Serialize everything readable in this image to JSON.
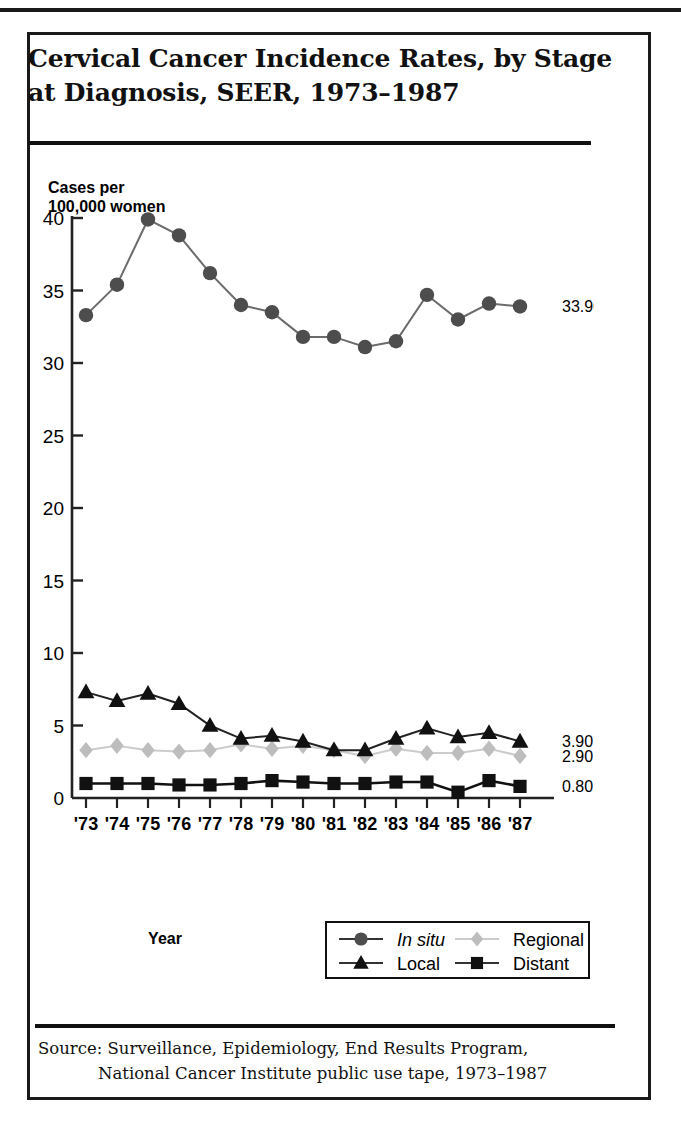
{
  "figure": {
    "title_line_1": "Cervical Cancer Incidence Rates, by Stage",
    "title_line_2": "at Diagnosis, SEER, 1973–1987",
    "source_line_1": "Source: Surveillance, Epidemiology, End Results Program,",
    "source_line_2": "National Cancer Institute public use tape, 1973–1987"
  },
  "chart_data": {
    "type": "line",
    "title": "Cervical Cancer Incidence Rates, by Stage at Diagnosis, SEER, 1973–1987",
    "xlabel": "Year",
    "ylabel": "Cases per 100,000 women",
    "ylabel_line_1": "Cases per",
    "ylabel_line_2": "100,000 women",
    "grid": false,
    "legend_position": "bottom-right",
    "ylim": [
      0,
      40
    ],
    "yticks": [
      0,
      5,
      10,
      15,
      20,
      25,
      30,
      35,
      40
    ],
    "ytick_labels": [
      "0",
      "5",
      "10",
      "15",
      "20",
      "25",
      "30",
      "35",
      "40"
    ],
    "categories": [
      "1973",
      "1974",
      "1975",
      "1976",
      "1977",
      "1978",
      "1979",
      "1980",
      "1981",
      "1982",
      "1983",
      "1984",
      "1985",
      "1986",
      "1987"
    ],
    "tick_labels": [
      "'73",
      "'74",
      "'75",
      "'76",
      "'77",
      "'78",
      "'79",
      "'80",
      "'81",
      "'82",
      "'83",
      "'84",
      "'85",
      "'86",
      "'87"
    ],
    "series": [
      {
        "name": "In situ",
        "italic": true,
        "marker": "circle",
        "color": "#4d4d4d",
        "line_color": "#6b6b6b",
        "end_label": "33.90",
        "values": [
          33.3,
          35.4,
          39.9,
          38.8,
          36.2,
          34.0,
          33.5,
          31.8,
          31.8,
          31.1,
          31.5,
          34.7,
          33.0,
          34.1,
          33.9
        ]
      },
      {
        "name": "Local",
        "italic": false,
        "marker": "triangle",
        "color": "#111111",
        "line_color": "#222222",
        "end_label": "3.90",
        "values": [
          7.3,
          6.7,
          7.2,
          6.5,
          5.0,
          4.1,
          4.3,
          3.9,
          3.3,
          3.3,
          4.1,
          4.8,
          4.2,
          4.5,
          3.9
        ]
      },
      {
        "name": "Regional",
        "italic": false,
        "marker": "diamond",
        "color": "#bdbdbd",
        "line_color": "#cccccc",
        "end_label": "2.90",
        "values": [
          3.3,
          3.6,
          3.3,
          3.2,
          3.3,
          3.7,
          3.4,
          3.6,
          3.3,
          2.9,
          3.4,
          3.1,
          3.1,
          3.4,
          2.9
        ]
      },
      {
        "name": "Distant",
        "italic": false,
        "marker": "square",
        "color": "#111111",
        "line_color": "#111111",
        "end_label": "0.80",
        "values": [
          1.0,
          1.0,
          1.0,
          0.9,
          0.9,
          1.0,
          1.2,
          1.1,
          1.0,
          1.0,
          1.1,
          1.1,
          0.4,
          1.2,
          0.8
        ]
      }
    ]
  },
  "legend": {
    "entries": [
      {
        "label": "In situ",
        "marker": "circle",
        "color": "#4d4d4d",
        "italic": true
      },
      {
        "label": "Regional",
        "marker": "diamond",
        "color": "#bdbdbd",
        "italic": false
      },
      {
        "label": "Local",
        "marker": "triangle",
        "color": "#111111",
        "italic": false
      },
      {
        "label": "Distant",
        "marker": "square",
        "color": "#111111",
        "italic": false
      }
    ]
  }
}
